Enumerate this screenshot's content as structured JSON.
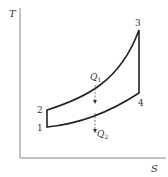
{
  "diagram": {
    "type": "T-S diagram (Brayton cycle)",
    "axes": {
      "y_label": "T",
      "x_label": "S"
    },
    "points": [
      {
        "id": "1",
        "label": "1"
      },
      {
        "id": "2",
        "label": "2"
      },
      {
        "id": "3",
        "label": "3"
      },
      {
        "id": "4",
        "label": "4"
      }
    ],
    "heat": {
      "q_in": {
        "symbol": "Q",
        "subscript": "1"
      },
      "q_out": {
        "symbol": "Q",
        "subscript": "2"
      }
    },
    "colors": {
      "axis": "#888888",
      "cycle": "#222222",
      "arrow": "#555555"
    }
  }
}
